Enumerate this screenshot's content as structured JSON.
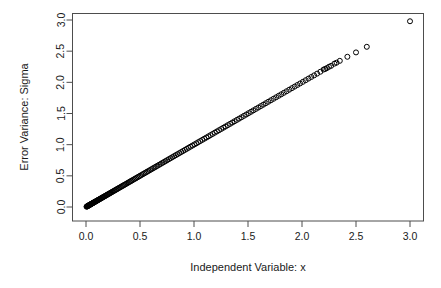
{
  "chart_data": {
    "type": "scatter",
    "title": "",
    "xlabel": "Independent Variable: x",
    "ylabel": "Error Variance: Sigma",
    "xlim": [
      -0.12,
      3.12
    ],
    "ylim": [
      -0.12,
      3.12
    ],
    "xticks": [
      0.0,
      0.5,
      1.0,
      1.5,
      2.0,
      2.5,
      3.0
    ],
    "yticks": [
      0.0,
      0.5,
      1.0,
      1.5,
      2.0,
      2.5,
      3.0
    ],
    "xtick_labels": [
      "0.0",
      "0.5",
      "1.0",
      "1.5",
      "2.0",
      "2.5",
      "3.0"
    ],
    "ytick_labels": [
      "0.0",
      "0.5",
      "1.0",
      "1.5",
      "2.0",
      "2.5",
      "3.0"
    ],
    "grid": false,
    "legend": false,
    "marker": "open-circle",
    "marker_size": 5,
    "marker_color": "#000000",
    "series": [
      {
        "name": "sigma vs x",
        "relationship": "identity",
        "note": "Points lie on the line y = x; density is extremely high near the origin and decreases toward large x.",
        "points": [
          [
            0.005,
            0.005
          ],
          [
            0.008,
            0.008
          ],
          [
            0.011,
            0.011
          ],
          [
            0.014,
            0.014
          ],
          [
            0.017,
            0.017
          ],
          [
            0.02,
            0.02
          ],
          [
            0.023,
            0.023
          ],
          [
            0.026,
            0.026
          ],
          [
            0.029,
            0.029
          ],
          [
            0.032,
            0.032
          ],
          [
            0.035,
            0.035
          ],
          [
            0.038,
            0.038
          ],
          [
            0.041,
            0.041
          ],
          [
            0.045,
            0.045
          ],
          [
            0.048,
            0.048
          ],
          [
            0.052,
            0.052
          ],
          [
            0.056,
            0.056
          ],
          [
            0.06,
            0.06
          ],
          [
            0.064,
            0.064
          ],
          [
            0.068,
            0.068
          ],
          [
            0.072,
            0.072
          ],
          [
            0.076,
            0.076
          ],
          [
            0.08,
            0.08
          ],
          [
            0.085,
            0.085
          ],
          [
            0.09,
            0.09
          ],
          [
            0.095,
            0.095
          ],
          [
            0.1,
            0.1
          ],
          [
            0.105,
            0.105
          ],
          [
            0.11,
            0.11
          ],
          [
            0.116,
            0.116
          ],
          [
            0.122,
            0.122
          ],
          [
            0.128,
            0.128
          ],
          [
            0.134,
            0.134
          ],
          [
            0.14,
            0.14
          ],
          [
            0.146,
            0.146
          ],
          [
            0.152,
            0.152
          ],
          [
            0.158,
            0.158
          ],
          [
            0.165,
            0.165
          ],
          [
            0.172,
            0.172
          ],
          [
            0.179,
            0.179
          ],
          [
            0.186,
            0.186
          ],
          [
            0.193,
            0.193
          ],
          [
            0.2,
            0.2
          ],
          [
            0.208,
            0.208
          ],
          [
            0.216,
            0.216
          ],
          [
            0.224,
            0.224
          ],
          [
            0.232,
            0.232
          ],
          [
            0.24,
            0.24
          ],
          [
            0.248,
            0.248
          ],
          [
            0.257,
            0.257
          ],
          [
            0.266,
            0.266
          ],
          [
            0.275,
            0.275
          ],
          [
            0.284,
            0.284
          ],
          [
            0.293,
            0.293
          ],
          [
            0.302,
            0.302
          ],
          [
            0.312,
            0.312
          ],
          [
            0.322,
            0.322
          ],
          [
            0.332,
            0.332
          ],
          [
            0.342,
            0.342
          ],
          [
            0.352,
            0.352
          ],
          [
            0.362,
            0.362
          ],
          [
            0.373,
            0.373
          ],
          [
            0.384,
            0.384
          ],
          [
            0.395,
            0.395
          ],
          [
            0.406,
            0.406
          ],
          [
            0.417,
            0.417
          ],
          [
            0.428,
            0.428
          ],
          [
            0.44,
            0.44
          ],
          [
            0.452,
            0.452
          ],
          [
            0.464,
            0.464
          ],
          [
            0.476,
            0.476
          ],
          [
            0.488,
            0.488
          ],
          [
            0.5,
            0.5
          ],
          [
            0.513,
            0.513
          ],
          [
            0.526,
            0.526
          ],
          [
            0.539,
            0.539
          ],
          [
            0.552,
            0.552
          ],
          [
            0.565,
            0.565
          ],
          [
            0.578,
            0.578
          ],
          [
            0.592,
            0.592
          ],
          [
            0.606,
            0.606
          ],
          [
            0.62,
            0.62
          ],
          [
            0.634,
            0.634
          ],
          [
            0.648,
            0.648
          ],
          [
            0.662,
            0.662
          ],
          [
            0.677,
            0.677
          ],
          [
            0.692,
            0.692
          ],
          [
            0.707,
            0.707
          ],
          [
            0.722,
            0.722
          ],
          [
            0.737,
            0.737
          ],
          [
            0.752,
            0.752
          ],
          [
            0.768,
            0.768
          ],
          [
            0.784,
            0.784
          ],
          [
            0.8,
            0.8
          ],
          [
            0.816,
            0.816
          ],
          [
            0.832,
            0.832
          ],
          [
            0.848,
            0.848
          ],
          [
            0.865,
            0.865
          ],
          [
            0.882,
            0.882
          ],
          [
            0.899,
            0.899
          ],
          [
            0.916,
            0.916
          ],
          [
            0.933,
            0.933
          ],
          [
            0.95,
            0.95
          ],
          [
            0.968,
            0.968
          ],
          [
            0.986,
            0.986
          ],
          [
            1.004,
            1.004
          ],
          [
            1.022,
            1.022
          ],
          [
            1.04,
            1.04
          ],
          [
            1.058,
            1.058
          ],
          [
            1.077,
            1.077
          ],
          [
            1.096,
            1.096
          ],
          [
            1.115,
            1.115
          ],
          [
            1.134,
            1.134
          ],
          [
            1.153,
            1.153
          ],
          [
            1.172,
            1.172
          ],
          [
            1.192,
            1.192
          ],
          [
            1.212,
            1.212
          ],
          [
            1.232,
            1.232
          ],
          [
            1.252,
            1.252
          ],
          [
            1.272,
            1.272
          ],
          [
            1.292,
            1.292
          ],
          [
            1.313,
            1.313
          ],
          [
            1.334,
            1.334
          ],
          [
            1.355,
            1.355
          ],
          [
            1.376,
            1.376
          ],
          [
            1.397,
            1.397
          ],
          [
            1.418,
            1.418
          ],
          [
            1.44,
            1.44
          ],
          [
            1.462,
            1.462
          ],
          [
            1.484,
            1.484
          ],
          [
            1.506,
            1.506
          ],
          [
            1.528,
            1.528
          ],
          [
            1.55,
            1.55
          ],
          [
            1.573,
            1.573
          ],
          [
            1.596,
            1.596
          ],
          [
            1.619,
            1.619
          ],
          [
            1.642,
            1.642
          ],
          [
            1.665,
            1.665
          ],
          [
            1.688,
            1.688
          ],
          [
            1.712,
            1.712
          ],
          [
            1.736,
            1.736
          ],
          [
            1.76,
            1.76
          ],
          [
            1.784,
            1.784
          ],
          [
            1.808,
            1.808
          ],
          [
            1.832,
            1.832
          ],
          [
            1.857,
            1.857
          ],
          [
            1.882,
            1.882
          ],
          [
            1.907,
            1.907
          ],
          [
            1.932,
            1.932
          ],
          [
            1.957,
            1.957
          ],
          [
            1.982,
            1.982
          ],
          [
            2.008,
            2.008
          ],
          [
            2.034,
            2.034
          ],
          [
            2.06,
            2.06
          ],
          [
            2.086,
            2.086
          ],
          [
            2.112,
            2.112
          ],
          [
            2.14,
            2.14
          ],
          [
            2.17,
            2.17
          ],
          [
            2.2,
            2.205
          ],
          [
            2.215,
            2.215
          ],
          [
            2.23,
            2.228
          ],
          [
            2.25,
            2.25
          ],
          [
            2.27,
            2.265
          ],
          [
            2.3,
            2.3
          ],
          [
            2.32,
            2.315
          ],
          [
            2.35,
            2.345
          ],
          [
            2.42,
            2.41
          ],
          [
            2.5,
            2.48
          ],
          [
            2.6,
            2.57
          ],
          [
            3.0,
            2.98
          ]
        ]
      }
    ]
  },
  "axes": {
    "x_title": "Independent Variable: x",
    "y_title": "Error Variance: Sigma"
  }
}
